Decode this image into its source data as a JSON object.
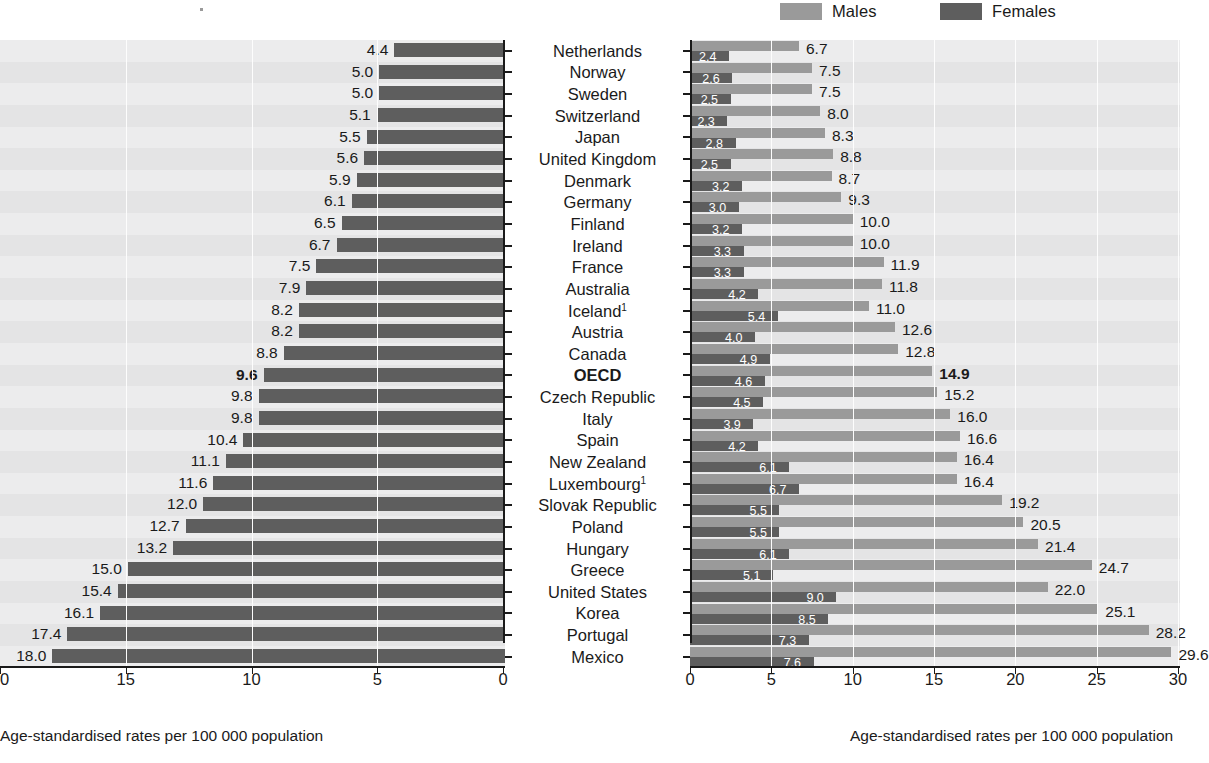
{
  "legend": {
    "items": [
      {
        "label": "Males",
        "color": "#9a9a9a",
        "name": "legend-males"
      },
      {
        "label": "Females",
        "color": "#5e5e5e",
        "name": "legend-females"
      }
    ]
  },
  "left_panel": {
    "axis_caption": "Age-standardised rates per 100 000 population",
    "ticks": [
      20,
      15,
      10,
      5,
      0
    ]
  },
  "right_panel": {
    "axis_caption": "Age-standardised rates per 100 000 population",
    "ticks": [
      0,
      5,
      10,
      15,
      20,
      25,
      30
    ]
  },
  "chart_data": {
    "type": "bar",
    "title": "",
    "orientation": "horizontal",
    "layout": "back-to-back paired panels",
    "categories": [
      "Netherlands",
      "Norway",
      "Sweden",
      "Switzerland",
      "Japan",
      "United Kingdom",
      "Denmark",
      "Germany",
      "Finland",
      "Ireland",
      "France",
      "Australia",
      "Iceland¹",
      "Austria",
      "Canada",
      "OECD",
      "Czech Republic",
      "Italy",
      "Spain",
      "New Zealand",
      "Luxembourg¹",
      "Slovak Republic",
      "Poland",
      "Hungary",
      "Greece",
      "United States",
      "Korea",
      "Portugal",
      "Mexico"
    ],
    "highlight_category": "OECD",
    "series": [
      {
        "name": "Total",
        "panel": "left",
        "color": "#5e5e5e",
        "xlabel": "Age-standardised rates per 100 000 population",
        "xlim": [
          20,
          0
        ],
        "reversed": true,
        "values": [
          4.4,
          5.0,
          5.0,
          5.1,
          5.5,
          5.6,
          5.9,
          6.1,
          6.5,
          6.7,
          7.5,
          7.9,
          8.2,
          8.2,
          8.8,
          9.6,
          9.8,
          9.8,
          10.4,
          11.1,
          11.6,
          12.0,
          12.7,
          13.2,
          15.0,
          15.4,
          16.1,
          17.4,
          18.0
        ]
      },
      {
        "name": "Males",
        "panel": "right",
        "color": "#9a9a9a",
        "xlabel": "Age-standardised rates per 100 000 population",
        "xlim": [
          0,
          30
        ],
        "values": [
          6.7,
          7.5,
          7.5,
          8.0,
          8.3,
          8.8,
          8.7,
          9.3,
          10.0,
          10.0,
          11.9,
          11.8,
          11.0,
          12.6,
          12.8,
          14.9,
          15.2,
          16.0,
          16.6,
          16.4,
          16.4,
          19.2,
          20.5,
          21.4,
          24.7,
          22.0,
          25.1,
          28.2,
          29.6
        ]
      },
      {
        "name": "Females",
        "panel": "right",
        "color": "#5e5e5e",
        "xlabel": "Age-standardised rates per 100 000 population",
        "xlim": [
          0,
          30
        ],
        "values": [
          2.4,
          2.6,
          2.5,
          2.3,
          2.8,
          2.5,
          3.2,
          3.0,
          3.2,
          3.3,
          3.3,
          4.2,
          5.4,
          4.0,
          4.9,
          4.6,
          4.5,
          3.9,
          4.2,
          6.1,
          6.7,
          5.5,
          5.5,
          6.1,
          5.1,
          9.0,
          8.5,
          7.3,
          7.6
        ]
      }
    ],
    "grid": true,
    "legend_position": "top-right",
    "footnote_marker": "1"
  }
}
